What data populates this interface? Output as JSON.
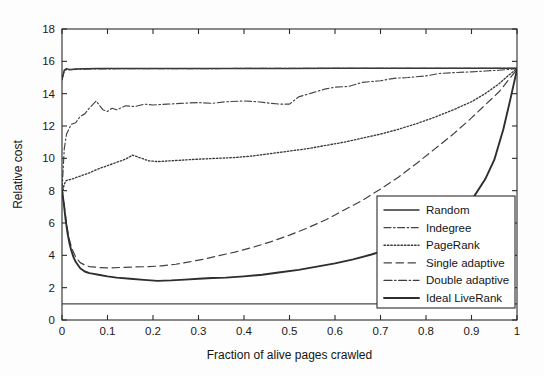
{
  "chart_data": {
    "type": "line",
    "title": "",
    "xlabel": "Fraction of alive pages crawled",
    "ylabel": "Relative cost",
    "xlim": [
      0,
      1
    ],
    "ylim": [
      0,
      18
    ],
    "xticks": [
      0,
      0.1,
      0.2,
      0.3,
      0.4,
      0.5,
      0.6,
      0.7,
      0.8,
      0.9,
      1
    ],
    "xticklabels": [
      "0",
      "0.1",
      "0.2",
      "0.3",
      "0.4",
      "0.5",
      "0.6",
      "0.7",
      "0.8",
      "0.9",
      "1"
    ],
    "yticks": [
      0,
      2,
      4,
      6,
      8,
      10,
      12,
      14,
      16,
      18
    ],
    "yticklabels": [
      "0",
      "2",
      "4",
      "6",
      "8",
      "10",
      "12",
      "14",
      "16",
      "18"
    ],
    "grid": false,
    "legend_position": "lower-right",
    "series": [
      {
        "name": "Random",
        "style": "solid",
        "x": [
          0,
          0.005,
          0.01,
          0.015,
          0.02,
          0.03,
          0.05,
          0.08,
          0.12,
          0.2,
          0.3,
          0.4,
          0.5,
          0.6,
          0.7,
          0.8,
          0.9,
          0.95,
          1
        ],
        "y": [
          14.9,
          15.45,
          15.55,
          15.5,
          15.5,
          15.52,
          15.54,
          15.55,
          15.55,
          15.56,
          15.56,
          15.56,
          15.56,
          15.57,
          15.57,
          15.57,
          15.57,
          15.57,
          15.57
        ]
      },
      {
        "name": "Indegree",
        "style": "dashdot",
        "x": [
          0,
          0.005,
          0.01,
          0.02,
          0.03,
          0.04,
          0.05,
          0.06,
          0.07,
          0.075,
          0.09,
          0.1,
          0.11,
          0.12,
          0.14,
          0.16,
          0.18,
          0.2,
          0.23,
          0.26,
          0.3,
          0.33,
          0.36,
          0.4,
          0.43,
          0.46,
          0.48,
          0.5,
          0.52,
          0.55,
          0.58,
          0.6,
          0.63,
          0.66,
          0.7,
          0.73,
          0.76,
          0.8,
          0.83,
          0.86,
          0.9,
          0.93,
          0.96,
          0.98,
          1
        ],
        "y": [
          8.0,
          10.6,
          11.5,
          12.1,
          12.2,
          12.6,
          12.75,
          13.1,
          13.4,
          13.55,
          13.0,
          12.9,
          13.1,
          13.0,
          13.25,
          13.2,
          13.35,
          13.3,
          13.35,
          13.4,
          13.45,
          13.4,
          13.5,
          13.55,
          13.5,
          13.4,
          13.35,
          13.35,
          13.8,
          14.05,
          14.3,
          14.4,
          14.45,
          14.7,
          14.8,
          14.95,
          15.0,
          15.1,
          15.25,
          15.3,
          15.35,
          15.4,
          15.45,
          15.5,
          15.55
        ]
      },
      {
        "name": "PageRank",
        "style": "dotted",
        "x": [
          0,
          0.004,
          0.008,
          0.012,
          0.02,
          0.03,
          0.04,
          0.05,
          0.06,
          0.08,
          0.1,
          0.12,
          0.14,
          0.155,
          0.17,
          0.19,
          0.21,
          0.24,
          0.27,
          0.3,
          0.34,
          0.38,
          0.42,
          0.46,
          0.5,
          0.54,
          0.58,
          0.62,
          0.66,
          0.7,
          0.74,
          0.78,
          0.82,
          0.86,
          0.9,
          0.93,
          0.96,
          0.98,
          1
        ],
        "y": [
          7.6,
          8.3,
          8.6,
          8.65,
          8.7,
          8.8,
          8.9,
          9.0,
          9.1,
          9.35,
          9.55,
          9.75,
          9.95,
          10.2,
          10.05,
          9.85,
          9.8,
          9.85,
          9.9,
          9.95,
          10.0,
          10.05,
          10.15,
          10.3,
          10.45,
          10.6,
          10.8,
          11.0,
          11.25,
          11.5,
          11.8,
          12.15,
          12.55,
          13.0,
          13.5,
          14.0,
          14.6,
          15.1,
          15.55
        ]
      },
      {
        "name": "Single adaptive",
        "style": "dashed",
        "x": [
          0,
          0.004,
          0.008,
          0.012,
          0.016,
          0.02,
          0.025,
          0.03,
          0.04,
          0.05,
          0.06,
          0.08,
          0.1,
          0.13,
          0.16,
          0.19,
          0.22,
          0.25,
          0.28,
          0.31,
          0.34,
          0.38,
          0.42,
          0.46,
          0.5,
          0.54,
          0.58,
          0.62,
          0.66,
          0.7,
          0.74,
          0.78,
          0.82,
          0.86,
          0.9,
          0.93,
          0.96,
          0.98,
          1
        ],
        "y": [
          8.0,
          7.3,
          6.4,
          5.6,
          5.0,
          4.6,
          4.2,
          3.9,
          3.55,
          3.4,
          3.3,
          3.25,
          3.22,
          3.25,
          3.28,
          3.3,
          3.35,
          3.45,
          3.6,
          3.75,
          3.95,
          4.2,
          4.5,
          4.85,
          5.25,
          5.7,
          6.2,
          6.8,
          7.4,
          8.1,
          8.85,
          9.7,
          10.6,
          11.5,
          12.5,
          13.3,
          14.1,
          14.8,
          15.5
        ]
      },
      {
        "name": "Double adaptive",
        "style": "dashdot-fine",
        "x": [
          0,
          0.005,
          0.01,
          0.02,
          0.03,
          0.05,
          0.08,
          0.12,
          0.2,
          0.3,
          0.4,
          0.5,
          0.6,
          0.7,
          0.8,
          0.9,
          1
        ],
        "y": [
          14.85,
          15.4,
          15.5,
          15.48,
          15.5,
          15.52,
          15.53,
          15.54,
          15.55,
          15.55,
          15.56,
          15.56,
          15.56,
          15.56,
          15.57,
          15.57,
          15.57
        ]
      },
      {
        "name": "Ideal LiveRank",
        "style": "solid-thick",
        "x": [
          0,
          0.004,
          0.008,
          0.012,
          0.016,
          0.02,
          0.025,
          0.03,
          0.04,
          0.05,
          0.06,
          0.07,
          0.08,
          0.1,
          0.12,
          0.15,
          0.18,
          0.21,
          0.24,
          0.27,
          0.3,
          0.33,
          0.36,
          0.4,
          0.44,
          0.48,
          0.52,
          0.56,
          0.6,
          0.64,
          0.68,
          0.72,
          0.76,
          0.8,
          0.84,
          0.87,
          0.9,
          0.93,
          0.95,
          0.97,
          0.985,
          1
        ],
        "y": [
          8.0,
          7.2,
          6.2,
          5.4,
          4.8,
          4.35,
          3.9,
          3.6,
          3.2,
          3.0,
          2.9,
          2.85,
          2.8,
          2.7,
          2.62,
          2.55,
          2.48,
          2.42,
          2.45,
          2.5,
          2.55,
          2.6,
          2.62,
          2.7,
          2.8,
          2.95,
          3.1,
          3.3,
          3.5,
          3.75,
          4.05,
          4.4,
          4.8,
          5.3,
          5.9,
          6.5,
          7.4,
          8.7,
          9.9,
          11.8,
          13.6,
          15.5
        ]
      },
      {
        "name": "Baseline",
        "style": "flat",
        "x": [
          0,
          1
        ],
        "y": [
          1.0,
          1.0
        ]
      }
    ],
    "legend": [
      {
        "label": "Random",
        "style": "solid"
      },
      {
        "label": "Indegree",
        "style": "dashdot"
      },
      {
        "label": "PageRank",
        "style": "dotted"
      },
      {
        "label": "Single adaptive",
        "style": "dashed"
      },
      {
        "label": "Double adaptive",
        "style": "dashdot-fine"
      },
      {
        "label": "Ideal LiveRank",
        "style": "solid-thick"
      }
    ]
  }
}
